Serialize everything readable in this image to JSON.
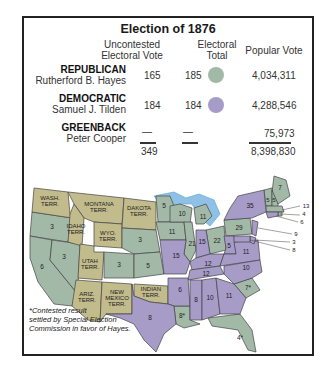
{
  "title": "Election of 1876",
  "headers": {
    "uncontested": [
      "Uncontested",
      "Electoral Vote"
    ],
    "electoral_total": [
      "Electoral",
      "Total"
    ],
    "popular": "Popular Vote"
  },
  "rows": [
    {
      "party": "REPUBLICAN",
      "candidate": "Rutherford B. Hayes",
      "uncontested": "165",
      "total": "185",
      "popular": "4,034,311",
      "color": "#a3b9a8"
    },
    {
      "party": "DEMOCRATIC",
      "candidate": "Samuel J. Tilden",
      "uncontested": "184",
      "total": "184",
      "popular": "4,288,546",
      "color": "#a79bc8"
    },
    {
      "party": "GREENBACK",
      "candidate": "Peter Cooper",
      "uncontested": "—",
      "total": "—",
      "popular": "75,973",
      "color": ""
    }
  ],
  "totals": {
    "uncontested": "349",
    "popular": "8,398,830"
  },
  "colors": {
    "republican": "#a3b9a8",
    "democratic": "#a79bc8",
    "territory": "#c2bb8c",
    "water": "#8fc0e6"
  },
  "map": {
    "territories": [
      "WASH. TERR.",
      "MONTANA TERR.",
      "DAKOTA TERR.",
      "IDAHO TERR.",
      "WYO. TERR.",
      "UTAH TERR.",
      "ARIZ. TERR.",
      "NEW MEXICO TERR.",
      "INDIAN TERR."
    ],
    "state_votes": [
      {
        "state": "Oregon",
        "votes": "3",
        "party": "R"
      },
      {
        "state": "California",
        "votes": "6",
        "party": "R"
      },
      {
        "state": "Nevada",
        "votes": "3",
        "party": "R"
      },
      {
        "state": "Colorado",
        "votes": "3",
        "party": "R"
      },
      {
        "state": "Nebraska",
        "votes": "3",
        "party": "R"
      },
      {
        "state": "Kansas",
        "votes": "5",
        "party": "R"
      },
      {
        "state": "Minnesota",
        "votes": "5",
        "party": "R"
      },
      {
        "state": "Iowa",
        "votes": "11",
        "party": "R"
      },
      {
        "state": "Wisconsin",
        "votes": "10",
        "party": "R"
      },
      {
        "state": "Illinois",
        "votes": "21",
        "party": "R"
      },
      {
        "state": "Michigan",
        "votes": "11",
        "party": "R"
      },
      {
        "state": "Ohio",
        "votes": "22",
        "party": "R"
      },
      {
        "state": "Pennsylvania",
        "votes": "29",
        "party": "R"
      },
      {
        "state": "Maine",
        "votes": "7",
        "party": "R"
      },
      {
        "state": "New Hampshire",
        "votes": "5",
        "party": "R"
      },
      {
        "state": "Vermont",
        "votes": "5",
        "party": "R"
      },
      {
        "state": "Massachusetts",
        "votes": "13",
        "party": "R"
      },
      {
        "state": "Rhode Island",
        "votes": "4",
        "party": "R"
      },
      {
        "state": "South Carolina",
        "votes": "7*",
        "party": "R"
      },
      {
        "state": "Louisiana",
        "votes": "8*",
        "party": "R"
      },
      {
        "state": "Florida",
        "votes": "4*",
        "party": "R"
      },
      {
        "state": "Missouri",
        "votes": "15",
        "party": "D"
      },
      {
        "state": "Indiana",
        "votes": "15",
        "party": "D"
      },
      {
        "state": "Kentucky",
        "votes": "12",
        "party": "D"
      },
      {
        "state": "West Virginia",
        "votes": "5",
        "party": "D"
      },
      {
        "state": "Virginia",
        "votes": "11",
        "party": "D"
      },
      {
        "state": "New York",
        "votes": "35",
        "party": "D"
      },
      {
        "state": "Connecticut",
        "votes": "6",
        "party": "D"
      },
      {
        "state": "New Jersey",
        "votes": "9",
        "party": "D"
      },
      {
        "state": "Delaware",
        "votes": "3",
        "party": "D"
      },
      {
        "state": "Maryland",
        "votes": "8",
        "party": "D"
      },
      {
        "state": "Tennessee",
        "votes": "12",
        "party": "D"
      },
      {
        "state": "North Carolina",
        "votes": "10",
        "party": "D"
      },
      {
        "state": "Arkansas",
        "votes": "6",
        "party": "D"
      },
      {
        "state": "Mississippi",
        "votes": "8",
        "party": "D"
      },
      {
        "state": "Alabama",
        "votes": "10",
        "party": "D"
      },
      {
        "state": "Georgia",
        "votes": "11",
        "party": "D"
      },
      {
        "state": "Texas",
        "votes": "8",
        "party": "D"
      }
    ]
  },
  "footnote": [
    "*Contested result",
    "settled by Special Election",
    "Commission in favor of Hayes."
  ]
}
